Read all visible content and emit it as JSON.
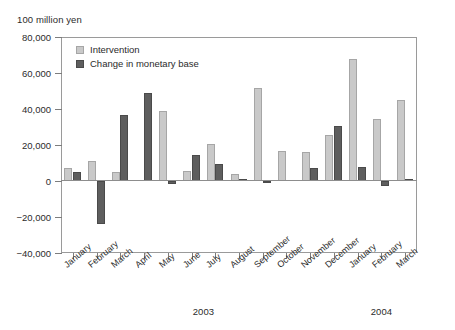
{
  "chart_data": {
    "type": "bar",
    "title": "",
    "subtitle": "",
    "unit_caption": "100 million yen",
    "xlabel": "",
    "ylabel": "",
    "ylim": [
      -40000,
      80000
    ],
    "yticks": [
      80000,
      60000,
      40000,
      20000,
      0,
      -20000,
      -40000
    ],
    "ytick_labels": [
      "80,000",
      "60,000",
      "40,000",
      "20,000",
      "0",
      "−20,000",
      "−40,000"
    ],
    "grid": false,
    "legend_position": "upper-left-inside",
    "categories": [
      "January",
      "February",
      "March",
      "April",
      "May",
      "June",
      "July",
      "August",
      "September",
      "October",
      "November",
      "December",
      "January",
      "February",
      "March"
    ],
    "group_captions": [
      {
        "label": "2003",
        "from_index": 0,
        "to_index": 11
      },
      {
        "label": "2004",
        "from_index": 12,
        "to_index": 14
      }
    ],
    "series": [
      {
        "name": "Intervention",
        "color": "#c9c9c9",
        "values": [
          7000,
          11000,
          5000,
          0,
          39000,
          5500,
          20500,
          4000,
          51500,
          16500,
          16000,
          25500,
          68000,
          34500,
          45000
        ]
      },
      {
        "name": "Change in monetary base",
        "color": "#5e5e5e",
        "values": [
          5000,
          -24000,
          36500,
          49000,
          -1500,
          14500,
          9500,
          1000,
          -1000,
          0,
          7500,
          30500,
          8000,
          -3000,
          1000
        ]
      }
    ]
  },
  "legend": {
    "items": [
      {
        "label": "Intervention"
      },
      {
        "label": "Change in monetary base"
      }
    ]
  }
}
